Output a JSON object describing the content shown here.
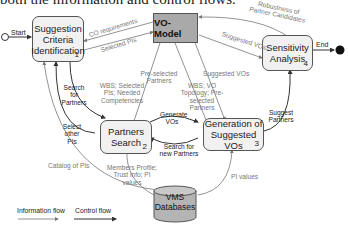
{
  "caption": "both the information and control flows.",
  "nodes": {
    "start": {
      "label": "Start"
    },
    "end": {
      "label": "End"
    },
    "step1": {
      "label": "Suggestion Criteria Identification",
      "num": "1"
    },
    "step2": {
      "label": "Partners Search",
      "num": "2"
    },
    "step3": {
      "label": "Generation of Suggested VOs",
      "num": "3"
    },
    "step4": {
      "label": "Sensitivity Analysis",
      "num": "4"
    },
    "vo_model": {
      "label": "VO-Model"
    },
    "vms_db": {
      "label_line1": "VMS",
      "label_line2": "Databases"
    }
  },
  "edges": {
    "co_requirements": "CO requirements",
    "selected_pis": "Selected PIs",
    "robustness": "Robustness of Partner Candidates",
    "suggested_vos_top": "Suggested VOs",
    "search_for_partners": "Search for Partners",
    "select_other_pis": "Select other PIs",
    "wbs_1": "WBS; Selected PIs; Needed Competencies",
    "pre_selected_partners": "Pre-selected Partners",
    "suggested_vos_mid": "Suggested VOs",
    "wbs_2": "WBS; VO Topology; Pre-selected Partners",
    "generate_vos": "Generate VOs",
    "search_new_partners": "Search for new Partners",
    "suggest_partners": "Suggest Partners",
    "catalog_of_pis": "Catalog of PIs",
    "members_profile": "Members Profile; Trust info; PI values",
    "pi_values": "PI values"
  },
  "legend": {
    "information_flow": "Information flow",
    "control_flow": "Control flow"
  },
  "colors": {
    "box_fill": "#f1f1f1",
    "vo_model_fill": "#a9a9a9",
    "db_fill": "#b4b4b4",
    "info_line": "#8a8a8a",
    "control_line": "#333333"
  }
}
